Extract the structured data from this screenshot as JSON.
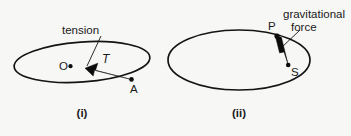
{
  "figure": {
    "background_color": "#f7f7f5",
    "ink_color": "#141414",
    "panels": [
      {
        "id": "panel-i",
        "caption": "(i)",
        "orbit": {
          "shape": "ellipse",
          "cx": 82,
          "cy": 62,
          "rx": 68,
          "ry": 20,
          "rotation": -4
        },
        "callout": {
          "text": "tension",
          "x": 84,
          "y": 32
        },
        "vector": {
          "label": "T",
          "from_point": "A",
          "to_point": "O",
          "description": "tension arrow from A toward O"
        },
        "points": [
          {
            "label": "O",
            "x": 68,
            "y": 66,
            "role": "centre"
          },
          {
            "label": "A",
            "x": 131,
            "y": 80,
            "role": "orbiting-body"
          }
        ]
      },
      {
        "id": "panel-ii",
        "caption": "(ii)",
        "orbit": {
          "shape": "ellipse",
          "cx": 239,
          "cy": 60,
          "rx": 71,
          "ry": 30,
          "rotation": 0
        },
        "callout": {
          "text_line1": "gravitational",
          "text_line2": "force",
          "x": 283,
          "y": 14
        },
        "vector": {
          "label": "",
          "from_point": "P",
          "to_point": "S",
          "description": "gravitational force arrow from P toward S"
        },
        "points": [
          {
            "label": "P",
            "x": 277,
            "y": 35,
            "role": "orbiting-body"
          },
          {
            "label": "S",
            "x": 288,
            "y": 66,
            "role": "centre"
          }
        ]
      }
    ]
  }
}
